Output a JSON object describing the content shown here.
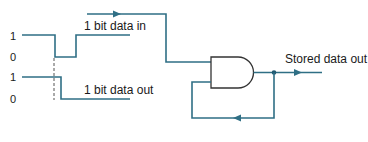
{
  "diagram": {
    "type": "memory-cell-and-gate-feedback",
    "labels": {
      "data_in": "1 bit data in",
      "data_out": "1 bit data out",
      "stored_out": "Stored data out"
    },
    "waveform_levels": {
      "in_high": "1",
      "in_low": "0",
      "out_high": "1",
      "out_low": "0"
    },
    "gate": {
      "kind": "AND"
    },
    "colors": {
      "wire": "#2f6f85",
      "gate_outline": "#333333",
      "text": "#1a1a1a"
    }
  }
}
